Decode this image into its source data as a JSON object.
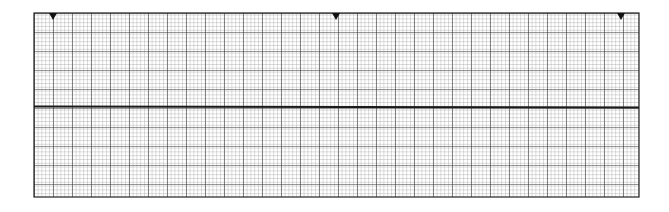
{
  "figure": {
    "title": "ECG rhythm strip grid"
  },
  "grid": {
    "left": 34,
    "top": 13,
    "right": 639,
    "bottom": 197,
    "major_spacing_px": 19,
    "minor_per_major": 5,
    "minor_color": "#9a9a9a",
    "major_color": "#333333",
    "border_color": "#222222",
    "background": "#ffffff"
  },
  "trace": {
    "type": "flat baseline",
    "y": 107,
    "color": "#1a1a1a",
    "stroke_width": 2
  },
  "markers": [
    {
      "x": 53,
      "shape": "down-triangle"
    },
    {
      "x": 336,
      "shape": "down-triangle"
    },
    {
      "x": 621,
      "shape": "down-triangle"
    }
  ]
}
